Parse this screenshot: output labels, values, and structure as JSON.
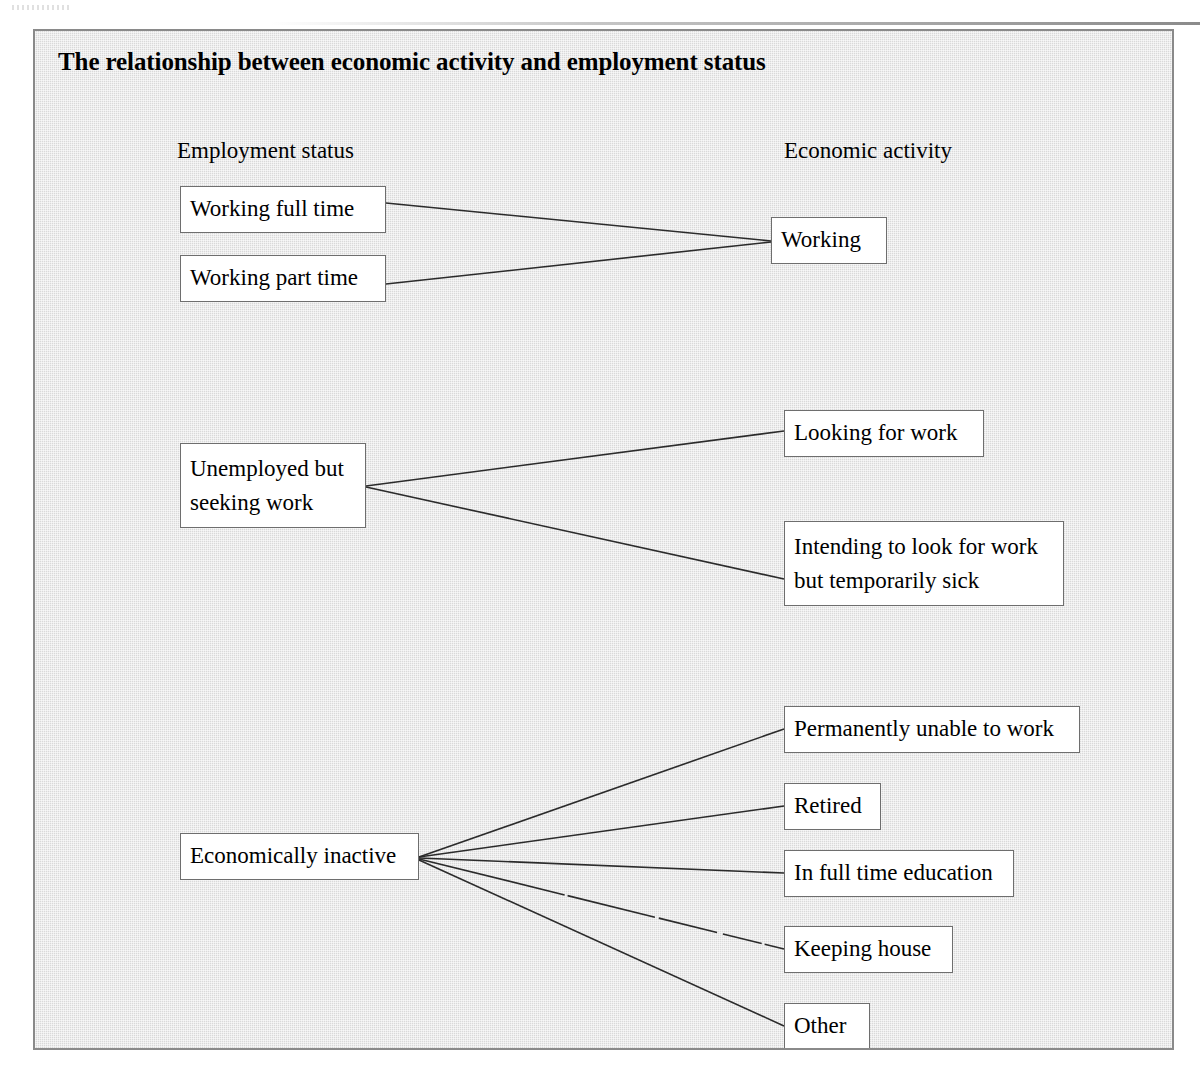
{
  "page": {
    "background_color": "#ffffff",
    "frame_background_color": "#d9d9d9",
    "frame_border_color": "#8a8a8a",
    "box_fill_color": "#ffffff",
    "box_border_color": "#6e6e6e",
    "line_color": "#2b2b2b",
    "text_color": "#000000"
  },
  "diagram": {
    "title": "The relationship between economic activity and employment status",
    "columns": {
      "left_header": "Employment status",
      "right_header": "Economic activity"
    },
    "employment_status_nodes": [
      {
        "id": "working-full-time",
        "label": "Working full time"
      },
      {
        "id": "working-part-time",
        "label": "Working part time"
      },
      {
        "id": "unemployed-seeking",
        "label": "Unemployed but\nseeking work"
      },
      {
        "id": "economically-inactive",
        "label": "Economically inactive"
      }
    ],
    "economic_activity_nodes": [
      {
        "id": "working",
        "label": "Working"
      },
      {
        "id": "looking-for-work",
        "label": "Looking for work"
      },
      {
        "id": "intending-sick",
        "label": "Intending to look for work\nbut temporarily sick"
      },
      {
        "id": "permanently-unable",
        "label": "Permanently unable to work"
      },
      {
        "id": "retired",
        "label": "Retired"
      },
      {
        "id": "full-time-education",
        "label": "In full time education"
      },
      {
        "id": "keeping-house",
        "label": "Keeping house"
      },
      {
        "id": "other",
        "label": "Other"
      }
    ],
    "connections": [
      {
        "from": "working-full-time",
        "to": "working"
      },
      {
        "from": "working-part-time",
        "to": "working"
      },
      {
        "from": "unemployed-seeking",
        "to": "looking-for-work"
      },
      {
        "from": "unemployed-seeking",
        "to": "intending-sick"
      },
      {
        "from": "economically-inactive",
        "to": "permanently-unable"
      },
      {
        "from": "economically-inactive",
        "to": "retired"
      },
      {
        "from": "economically-inactive",
        "to": "full-time-education"
      },
      {
        "from": "economically-inactive",
        "to": "keeping-house"
      },
      {
        "from": "economically-inactive",
        "to": "other"
      }
    ]
  }
}
